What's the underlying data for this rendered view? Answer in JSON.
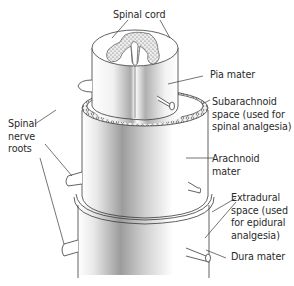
{
  "labels": {
    "spinal_cord": "Spinal cord",
    "pia_mater": "Pia mater",
    "subarachnoid": "Subarachnoid\nspace (used for\nspinal analgesia)",
    "arachnoid": "Arachnoid\nmater",
    "extradural": "Extradural\nspace (used\nfor epidural\nanalgesia)",
    "dura": "Dura mater",
    "nerve_roots": "Spinal\nnerve\nroots"
  },
  "colors": {
    "line": "#3a3a3a",
    "shade_dark": "#9a9a9a",
    "shade_light": "#ffffff",
    "stipple": "#555555"
  }
}
